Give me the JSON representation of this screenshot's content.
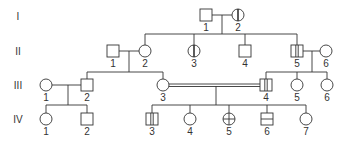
{
  "title": "",
  "generations": [
    {
      "label": "I",
      "y": 16
    },
    {
      "label": "II",
      "y": 51
    },
    {
      "label": "III",
      "y": 85
    },
    {
      "label": "IV",
      "y": 119
    }
  ],
  "individuals": [
    {
      "id": "I-1",
      "gen": 0,
      "num": "1",
      "sex": "male",
      "x": 206,
      "y": 15,
      "pattern": "none"
    },
    {
      "id": "I-2",
      "gen": 0,
      "num": "2",
      "sex": "female",
      "x": 238,
      "y": 15,
      "pattern": "vertical-line"
    },
    {
      "id": "II-1",
      "gen": 1,
      "num": "1",
      "sex": "male",
      "x": 113,
      "y": 51,
      "pattern": "none"
    },
    {
      "id": "II-2",
      "gen": 1,
      "num": "2",
      "sex": "female",
      "x": 145,
      "y": 51,
      "pattern": "none"
    },
    {
      "id": "II-3",
      "gen": 1,
      "num": "3",
      "sex": "female",
      "x": 194,
      "y": 51,
      "pattern": "vertical-line"
    },
    {
      "id": "II-4",
      "gen": 1,
      "num": "4",
      "sex": "male",
      "x": 245,
      "y": 51,
      "pattern": "none"
    },
    {
      "id": "II-5",
      "gen": 1,
      "num": "5",
      "sex": "male",
      "x": 297,
      "y": 51,
      "pattern": "double-vertical"
    },
    {
      "id": "II-6",
      "gen": 1,
      "num": "6",
      "sex": "female",
      "x": 326,
      "y": 51,
      "pattern": "none"
    },
    {
      "id": "III-1",
      "gen": 2,
      "num": "1",
      "sex": "female",
      "x": 46,
      "y": 85,
      "pattern": "none"
    },
    {
      "id": "III-2",
      "gen": 2,
      "num": "2",
      "sex": "male",
      "x": 87,
      "y": 85,
      "pattern": "none"
    },
    {
      "id": "III-3",
      "gen": 2,
      "num": "3",
      "sex": "female",
      "x": 163,
      "y": 85,
      "pattern": "none"
    },
    {
      "id": "III-4",
      "gen": 2,
      "num": "4",
      "sex": "male",
      "x": 266,
      "y": 85,
      "pattern": "double-vertical"
    },
    {
      "id": "III-5",
      "gen": 2,
      "num": "5",
      "sex": "female",
      "x": 297,
      "y": 85,
      "pattern": "none"
    },
    {
      "id": "III-6",
      "gen": 2,
      "num": "6",
      "sex": "female",
      "x": 327,
      "y": 85,
      "pattern": "none"
    },
    {
      "id": "IV-1",
      "gen": 3,
      "num": "1",
      "sex": "female",
      "x": 46,
      "y": 119,
      "pattern": "none"
    },
    {
      "id": "IV-2",
      "gen": 3,
      "num": "2",
      "sex": "male",
      "x": 87,
      "y": 119,
      "pattern": "none"
    },
    {
      "id": "IV-3",
      "gen": 3,
      "num": "3",
      "sex": "male",
      "x": 152,
      "y": 119,
      "pattern": "double-vertical"
    },
    {
      "id": "IV-4",
      "gen": 3,
      "num": "4",
      "sex": "female",
      "x": 190,
      "y": 119,
      "pattern": "none"
    },
    {
      "id": "IV-5",
      "gen": 3,
      "num": "5",
      "sex": "female",
      "x": 229,
      "y": 119,
      "pattern": "cross"
    },
    {
      "id": "IV-6",
      "gen": 3,
      "num": "6",
      "sex": "male",
      "x": 267,
      "y": 119,
      "pattern": "horizontal-line"
    },
    {
      "id": "IV-7",
      "gen": 3,
      "num": "7",
      "sex": "female",
      "x": 306,
      "y": 119,
      "pattern": "none"
    }
  ],
  "colors": {
    "stroke": "#333333",
    "text": "#333333",
    "background": "#ffffff"
  }
}
